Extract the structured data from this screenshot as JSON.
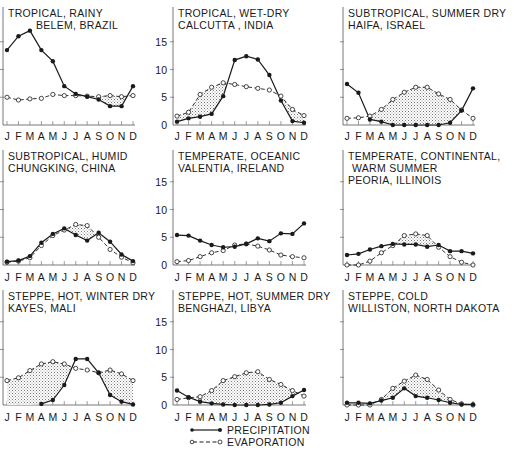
{
  "figure": {
    "legend": {
      "precipitation_label": "PRECIPITATION",
      "evaporation_label": "EVAPORATION"
    },
    "months": [
      "J",
      "F",
      "M",
      "A",
      "M",
      "J",
      "J",
      "A",
      "S",
      "O",
      "N",
      "D"
    ],
    "y_ticks": [
      "0",
      "5",
      "10",
      "15"
    ],
    "colors": {
      "line": "#1a1a1a",
      "stipple": "#9a9a9a",
      "axis": "#555555"
    }
  },
  "chart_data": [
    {
      "type": "line",
      "title": "TROPICAL, RAINY",
      "subtitle": "BELEM, BRAZIL",
      "categories": [
        "J",
        "F",
        "M",
        "A",
        "M",
        "J",
        "J",
        "A",
        "S",
        "O",
        "N",
        "D"
      ],
      "ylim": [
        0,
        18
      ],
      "yticks": [
        0,
        5,
        10,
        15
      ],
      "series": [
        {
          "name": "PRECIPITATION",
          "marker": "filled-circle",
          "style": "solid",
          "values": [
            13.5,
            16.0,
            17.0,
            13.5,
            11.5,
            7.0,
            5.6,
            5.1,
            4.6,
            3.4,
            3.4,
            7.0
          ]
        },
        {
          "name": "EVAPORATION",
          "marker": "open-circle",
          "style": "dashed",
          "values": [
            5.0,
            4.5,
            4.7,
            4.8,
            5.5,
            5.3,
            5.3,
            5.2,
            5.1,
            5.3,
            5.1,
            5.3
          ]
        }
      ],
      "shading": "stippled where evaporation exceeds precipitation"
    },
    {
      "type": "line",
      "title": "TROPICAL, WET-DRY",
      "subtitle": "CALCUTTA , INDIA",
      "categories": [
        "J",
        "F",
        "M",
        "A",
        "M",
        "J",
        "J",
        "A",
        "S",
        "O",
        "N",
        "D"
      ],
      "ylim": [
        0,
        18
      ],
      "yticks": [
        0,
        5,
        10,
        15
      ],
      "series": [
        {
          "name": "PRECIPITATION",
          "marker": "filled-circle",
          "style": "solid",
          "values": [
            0.6,
            1.2,
            1.5,
            2.0,
            5.2,
            11.7,
            12.4,
            11.8,
            9.0,
            4.4,
            0.7,
            0.4
          ]
        },
        {
          "name": "EVAPORATION",
          "marker": "open-circle",
          "style": "dashed",
          "values": [
            1.6,
            2.3,
            5.5,
            6.8,
            7.6,
            7.3,
            6.9,
            6.6,
            6.3,
            5.2,
            2.8,
            1.7
          ]
        }
      ],
      "shading": "stippled where evaporation exceeds precipitation"
    },
    {
      "type": "line",
      "title": "SUBTROPICAL, SUMMER DRY",
      "subtitle": "HAIFA, ISRAEL",
      "categories": [
        "J",
        "F",
        "M",
        "A",
        "M",
        "J",
        "J",
        "A",
        "S",
        "O",
        "N",
        "D"
      ],
      "ylim": [
        0,
        18
      ],
      "yticks": [
        0,
        5,
        10,
        15
      ],
      "series": [
        {
          "name": "PRECIPITATION",
          "marker": "filled-circle",
          "style": "solid",
          "values": [
            7.4,
            5.8,
            1.0,
            0.6,
            0.0,
            0.0,
            0.0,
            0.0,
            0.0,
            0.4,
            2.6,
            6.6
          ]
        },
        {
          "name": "EVAPORATION",
          "marker": "open-circle",
          "style": "dashed",
          "values": [
            1.2,
            1.3,
            1.6,
            2.8,
            4.6,
            5.9,
            6.8,
            6.8,
            5.6,
            4.6,
            2.7,
            1.2
          ]
        }
      ],
      "shading": "stippled where evaporation exceeds precipitation"
    },
    {
      "type": "line",
      "title": "SUBTROPICAL, HUMID",
      "subtitle": "CHUNGKING, CHINA",
      "categories": [
        "J",
        "F",
        "M",
        "A",
        "M",
        "J",
        "J",
        "A",
        "S",
        "O",
        "N",
        "D"
      ],
      "ylim": [
        0,
        18
      ],
      "yticks": [
        0,
        5,
        10,
        15
      ],
      "series": [
        {
          "name": "PRECIPITATION",
          "marker": "filled-circle",
          "style": "solid",
          "values": [
            0.6,
            0.8,
            1.6,
            4.0,
            5.6,
            6.6,
            5.4,
            4.4,
            5.8,
            4.2,
            1.9,
            0.7
          ]
        },
        {
          "name": "EVAPORATION",
          "marker": "open-circle",
          "style": "dashed",
          "values": [
            0.5,
            0.7,
            1.3,
            3.5,
            5.3,
            6.3,
            7.3,
            7.1,
            5.0,
            2.8,
            1.4,
            0.4
          ]
        }
      ],
      "shading": "stippled where evaporation exceeds precipitation"
    },
    {
      "type": "line",
      "title": "TEMPERATE, OCEANIC",
      "subtitle": "VALENTIA, IRELAND",
      "categories": [
        "J",
        "F",
        "M",
        "A",
        "M",
        "J",
        "J",
        "A",
        "S",
        "O",
        "N",
        "D"
      ],
      "ylim": [
        0,
        18
      ],
      "yticks": [
        0,
        5,
        10,
        15
      ],
      "series": [
        {
          "name": "PRECIPITATION",
          "marker": "filled-circle",
          "style": "solid",
          "values": [
            5.4,
            5.3,
            4.4,
            3.6,
            3.2,
            3.3,
            3.8,
            4.8,
            4.3,
            5.7,
            5.6,
            7.5
          ]
        },
        {
          "name": "EVAPORATION",
          "marker": "open-circle",
          "style": "dashed",
          "values": [
            0.6,
            0.8,
            1.5,
            2.2,
            2.6,
            3.6,
            3.8,
            3.4,
            2.7,
            1.8,
            1.5,
            1.3
          ]
        }
      ],
      "shading": "stippled where evaporation exceeds precipitation"
    },
    {
      "type": "line",
      "title": "TEMPERATE, CONTINENTAL,",
      "subtitle": "WARM SUMMER",
      "subtitle2": "PEORIA, ILLINOIS",
      "categories": [
        "J",
        "F",
        "M",
        "A",
        "M",
        "J",
        "J",
        "A",
        "S",
        "O",
        "N",
        "D"
      ],
      "ylim": [
        0,
        18
      ],
      "yticks": [
        0,
        5,
        10,
        15
      ],
      "series": [
        {
          "name": "PRECIPITATION",
          "marker": "filled-circle",
          "style": "solid",
          "values": [
            1.8,
            2.0,
            2.8,
            3.4,
            3.8,
            3.7,
            3.7,
            3.3,
            3.6,
            2.5,
            2.5,
            2.1
          ]
        },
        {
          "name": "EVAPORATION",
          "marker": "open-circle",
          "style": "dashed",
          "values": [
            0.0,
            0.0,
            0.7,
            2.2,
            3.5,
            5.3,
            5.6,
            5.3,
            3.2,
            1.5,
            0.5,
            0.0
          ]
        }
      ],
      "shading": "stippled where evaporation exceeds precipitation"
    },
    {
      "type": "line",
      "title": "STEPPE, HOT, WINTER DRY",
      "subtitle": "KAYES, MALI",
      "categories": [
        "J",
        "F",
        "M",
        "A",
        "M",
        "J",
        "J",
        "A",
        "S",
        "O",
        "N",
        "D"
      ],
      "ylim": [
        0,
        18
      ],
      "yticks": [
        0,
        5,
        10,
        15
      ],
      "series": [
        {
          "name": "PRECIPITATION",
          "marker": "filled-circle",
          "style": "solid",
          "values": [
            null,
            null,
            null,
            0.2,
            0.9,
            3.6,
            8.3,
            8.3,
            5.8,
            1.8,
            0.6,
            0.1
          ]
        },
        {
          "name": "EVAPORATION",
          "marker": "open-circle",
          "style": "dashed",
          "values": [
            4.4,
            4.9,
            6.2,
            7.4,
            7.8,
            7.4,
            6.6,
            6.3,
            5.8,
            6.3,
            5.6,
            4.4
          ]
        }
      ],
      "shading": "stippled where evaporation exceeds precipitation"
    },
    {
      "type": "line",
      "title": "STEPPE, HOT, SUMMER DRY",
      "subtitle": "BENGHAZI, LIBYA",
      "categories": [
        "J",
        "F",
        "M",
        "A",
        "M",
        "J",
        "J",
        "A",
        "S",
        "O",
        "N",
        "D"
      ],
      "ylim": [
        0,
        18
      ],
      "yticks": [
        0,
        5,
        10,
        15
      ],
      "series": [
        {
          "name": "PRECIPITATION",
          "marker": "filled-circle",
          "style": "solid",
          "values": [
            2.6,
            1.4,
            0.6,
            0.3,
            0.1,
            0.0,
            0.0,
            0.0,
            0.1,
            0.4,
            1.6,
            2.7
          ]
        },
        {
          "name": "EVAPORATION",
          "marker": "open-circle",
          "style": "dashed",
          "values": [
            1.0,
            1.3,
            1.5,
            2.6,
            4.4,
            5.1,
            5.8,
            6.0,
            4.6,
            3.7,
            2.6,
            1.6
          ]
        }
      ],
      "shading": "stippled where evaporation exceeds precipitation"
    },
    {
      "type": "line",
      "title": "STEPPE, COLD",
      "subtitle": "WILLISTON, NORTH DAKOTA",
      "categories": [
        "J",
        "F",
        "M",
        "A",
        "M",
        "J",
        "J",
        "A",
        "S",
        "O",
        "N",
        "D"
      ],
      "ylim": [
        0,
        18
      ],
      "yticks": [
        0,
        5,
        10,
        15
      ],
      "series": [
        {
          "name": "PRECIPITATION",
          "marker": "filled-circle",
          "style": "solid",
          "values": [
            0.4,
            0.4,
            0.3,
            0.8,
            1.3,
            3.0,
            1.6,
            1.3,
            0.9,
            0.4,
            0.1,
            0.1
          ]
        },
        {
          "name": "EVAPORATION",
          "marker": "open-circle",
          "style": "dashed",
          "values": [
            0.0,
            0.0,
            0.0,
            1.0,
            3.0,
            4.3,
            5.4,
            4.6,
            2.7,
            1.0,
            0.2,
            0.0
          ]
        }
      ],
      "shading": "stippled where evaporation exceeds precipitation"
    }
  ]
}
